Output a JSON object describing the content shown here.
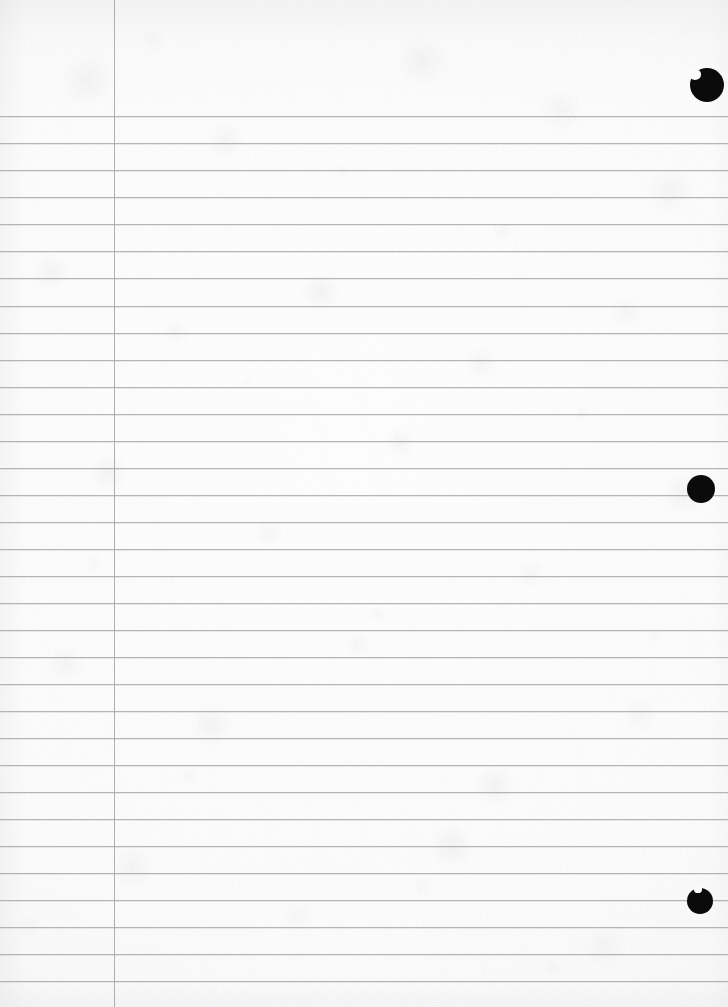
{
  "document": {
    "kind": "scanned-page",
    "subject": "blank ruled notebook paper",
    "width": 728,
    "height": 1007,
    "visible_text": "",
    "handwriting_present": "no",
    "printed_text_present": "no"
  },
  "paper": {
    "base_color": "#fbfbfb",
    "highlight_color": "#fdfdfd",
    "edge_shadow_color": "#f2f2f3",
    "texture": "mottled fibrous scan grain"
  },
  "ruling": {
    "line_color": "#a9a9ae",
    "line_thickness_px": 1,
    "first_line_y": 116,
    "spacing_px": 27.05,
    "count": 33,
    "header_band_height_px": 116,
    "line_y_positions": [
      116,
      143,
      170,
      197,
      224,
      251,
      278,
      306,
      333,
      360,
      387,
      414,
      441,
      468,
      495,
      522,
      549,
      576,
      603,
      630,
      657,
      684,
      711,
      738,
      765,
      792,
      819,
      846,
      873,
      900,
      927,
      954,
      981
    ]
  },
  "margin_rule": {
    "label": "left vertical margin rule",
    "color": "#a4a4aa",
    "x": 114,
    "thickness_px": 1,
    "spans_full_height": "yes"
  },
  "punch_holes": {
    "label": "binder punch holes",
    "color": "#0b0b0b",
    "count": 3,
    "items": [
      {
        "name": "punch-hole-top",
        "cx": 707,
        "cy": 85,
        "r": 17,
        "clipped_at_right_edge": "yes",
        "notch": "left"
      },
      {
        "name": "punch-hole-middle",
        "cx": 701,
        "cy": 489,
        "r": 14,
        "clipped_at_right_edge": "no",
        "notch": "none"
      },
      {
        "name": "punch-hole-bottom",
        "cx": 700,
        "cy": 901,
        "r": 13,
        "clipped_at_right_edge": "no",
        "notch": "top-left"
      }
    ]
  }
}
